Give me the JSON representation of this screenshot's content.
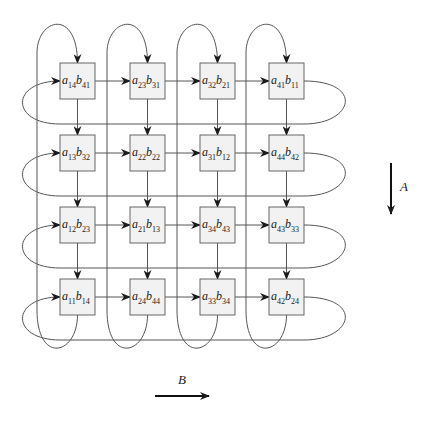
{
  "diagram": {
    "colors": {
      "box_fill": "#f2f2f2",
      "box_stroke": "#666666",
      "line": "#555555",
      "arrow": "#1a1a1a"
    },
    "grid": {
      "rows": 4,
      "cols": 4,
      "cells": [
        [
          {
            "a": "14",
            "b": "41"
          },
          {
            "a": "23",
            "b": "31"
          },
          {
            "a": "32",
            "b": "21"
          },
          {
            "a": "41",
            "b": "11"
          }
        ],
        [
          {
            "a": "13",
            "b": "32"
          },
          {
            "a": "22",
            "b": "22"
          },
          {
            "a": "31",
            "b": "12"
          },
          {
            "a": "44",
            "b": "42"
          }
        ],
        [
          {
            "a": "12",
            "b": "23"
          },
          {
            "a": "21",
            "b": "13"
          },
          {
            "a": "34",
            "b": "43"
          },
          {
            "a": "43",
            "b": "33"
          }
        ],
        [
          {
            "a": "11",
            "b": "14"
          },
          {
            "a": "24",
            "b": "44"
          },
          {
            "a": "33",
            "b": "34"
          },
          {
            "a": "42",
            "b": "24"
          }
        ]
      ]
    },
    "legend": {
      "a_arrow_label": "A",
      "a_direction": "down",
      "b_arrow_label": "B",
      "b_direction": "right"
    }
  }
}
